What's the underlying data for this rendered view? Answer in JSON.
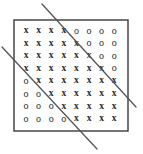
{
  "figure": {
    "canvas": {
      "width": 143,
      "height": 154,
      "background": "#ffffff"
    },
    "box": {
      "name": "data-region-box",
      "x": 14,
      "y": 20,
      "width": 114,
      "height": 111,
      "stroke": "#3a3a3a",
      "stroke_width": 1.4,
      "fill": "none"
    },
    "grid": {
      "rows": 8,
      "columns": 8,
      "origin_x": 26,
      "origin_y": 30,
      "step_x": 12.6,
      "step_y": 12.6,
      "symbol_color": "#2b2b2b",
      "class_x_label": "x",
      "class_o_label": "o",
      "cells": [
        [
          "x",
          "x",
          "x",
          "x",
          "o",
          "o",
          "o",
          "o"
        ],
        [
          "x",
          "x",
          "x",
          "x",
          "x",
          "o",
          "o",
          "o"
        ],
        [
          "x",
          "x",
          "x",
          "x",
          "x",
          "x",
          "o",
          "o"
        ],
        [
          "x",
          "x",
          "x",
          "x",
          "x",
          "x",
          "x",
          "o"
        ],
        [
          "o",
          "x",
          "x",
          "x",
          "x",
          "x",
          "x",
          "x"
        ],
        [
          "o",
          "o",
          "x",
          "x",
          "x",
          "x",
          "x",
          "x"
        ],
        [
          "o",
          "o",
          "o",
          "x",
          "x",
          "x",
          "x",
          "x"
        ],
        [
          "o",
          "o",
          "o",
          "o",
          "x",
          "x",
          "x",
          "x"
        ]
      ],
      "row_x_counts": [
        4,
        5,
        6,
        7,
        7,
        6,
        5,
        4
      ],
      "row_o_counts": [
        4,
        3,
        2,
        1,
        1,
        2,
        3,
        4
      ]
    },
    "lines": [
      {
        "name": "separator-line-upper",
        "x1": 42,
        "y1": 4,
        "x2": 136,
        "y2": 107,
        "stroke": "#555555",
        "stroke_width": 1.3
      },
      {
        "name": "separator-line-lower",
        "x1": 2,
        "y1": 47,
        "x2": 97,
        "y2": 149,
        "stroke": "#555555",
        "stroke_width": 1.3
      }
    ]
  }
}
